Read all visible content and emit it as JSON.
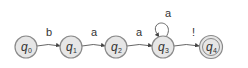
{
  "diagram": {
    "type": "finite-automaton",
    "states": [
      {
        "id": "q0",
        "name": "q",
        "sub": "0",
        "x": 26,
        "y": 47,
        "accepting": false
      },
      {
        "id": "q1",
        "name": "q",
        "sub": "1",
        "x": 71,
        "y": 47,
        "accepting": false
      },
      {
        "id": "q2",
        "name": "q",
        "sub": "2",
        "x": 116,
        "y": 47,
        "accepting": false
      },
      {
        "id": "q3",
        "name": "q",
        "sub": "3",
        "x": 163,
        "y": 47,
        "accepting": false
      },
      {
        "id": "q4",
        "name": "q",
        "sub": "4",
        "x": 211,
        "y": 47,
        "accepting": true
      }
    ],
    "transitions": [
      {
        "from": "q0",
        "to": "q1",
        "label": "b"
      },
      {
        "from": "q1",
        "to": "q2",
        "label": "a"
      },
      {
        "from": "q2",
        "to": "q3",
        "label": "a"
      },
      {
        "from": "q3",
        "to": "q3",
        "label": "a"
      },
      {
        "from": "q3",
        "to": "q4",
        "label": "!"
      }
    ],
    "colors": {
      "node_fill": "#e6e6e6",
      "node_stroke": "#8a8a8a",
      "edge": "#555555",
      "text": "#333333"
    }
  }
}
